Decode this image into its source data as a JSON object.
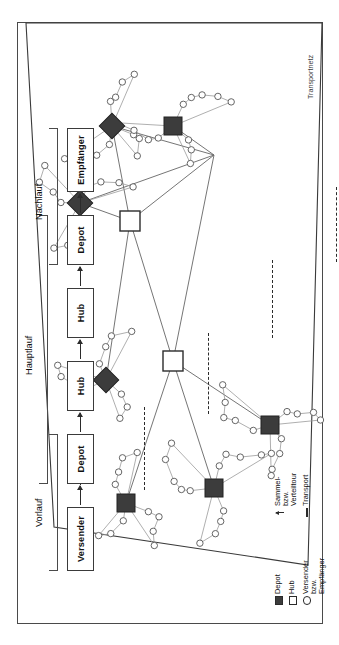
{
  "figure": {
    "title_label": "Transportnetz",
    "language": "de"
  },
  "process_chain": {
    "nodes": [
      {
        "id": "versender",
        "label": "Versender"
      },
      {
        "id": "depot_out",
        "label": "Depot"
      },
      {
        "id": "hub_1",
        "label": "Hub"
      },
      {
        "id": "hub_2",
        "label": "Hub"
      },
      {
        "id": "depot_in",
        "label": "Depot"
      },
      {
        "id": "empfaenger",
        "label": "Empfänger"
      }
    ],
    "brackets": [
      {
        "id": "vorlauf",
        "label": "Vorlauf",
        "spans": [
          "versender",
          "depot_out"
        ]
      },
      {
        "id": "hauptlauf",
        "label": "Hauptlauf",
        "spans": [
          "depot_out",
          "hub_1",
          "hub_2",
          "depot_in"
        ]
      },
      {
        "id": "nachlauf",
        "label": "Nachlauf",
        "spans": [
          "depot_in",
          "empfaenger"
        ]
      }
    ]
  },
  "legend": {
    "items": [
      {
        "symbol": "filled-square",
        "label": "Depot"
      },
      {
        "symbol": "open-square",
        "label": "Hub"
      },
      {
        "symbol": "open-circle",
        "label": "Versender\nbzw.\nEmpfänger"
      },
      {
        "symbol": "arrow",
        "label": "Sammel-\nbzw.\nVerteiltour"
      },
      {
        "symbol": "line",
        "label": "Transport"
      }
    ]
  },
  "chart_data": {
    "type": "diagram",
    "title": "Transportnetz",
    "network": {
      "hubs": [
        {
          "id": "H1",
          "x": 262,
          "y": 155
        },
        {
          "id": "H2",
          "x": 402,
          "y": 112
        },
        {
          "id": "H3",
          "x": 468,
          "y": 196
        }
      ],
      "depots": [
        {
          "id": "D1",
          "x": 135,
          "y": 196,
          "shape": "square"
        },
        {
          "id": "D2",
          "x": 198,
          "y": 252,
          "shape": "square"
        },
        {
          "id": "D3",
          "x": 120,
          "y": 108,
          "shape": "square"
        },
        {
          "id": "D4",
          "x": 243,
          "y": 88,
          "shape": "diamond"
        },
        {
          "id": "D5",
          "x": 420,
          "y": 62,
          "shape": "diamond"
        },
        {
          "id": "D6",
          "x": 497,
          "y": 94,
          "shape": "diamond"
        },
        {
          "id": "D7",
          "x": 497,
          "y": 155,
          "shape": "square"
        }
      ],
      "transport_links": [
        [
          "H1",
          "H2"
        ],
        [
          "H1",
          "H3"
        ],
        [
          "H2",
          "H3"
        ],
        [
          "H1",
          "D1"
        ],
        [
          "H1",
          "D2"
        ],
        [
          "H1",
          "D3"
        ],
        [
          "H2",
          "D4"
        ],
        [
          "H2",
          "D5"
        ],
        [
          "H2",
          "D6"
        ],
        [
          "H2",
          "D7"
        ],
        [
          "H3",
          "D5"
        ],
        [
          "H3",
          "D6"
        ],
        [
          "H3",
          "D7"
        ]
      ],
      "tour_customers_per_depot": 9
    }
  }
}
